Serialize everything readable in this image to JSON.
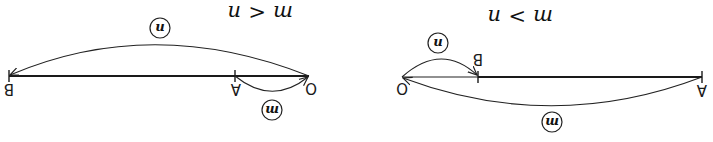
{
  "figure": {
    "orientation": "rotated 180 degrees",
    "panels": [
      {
        "id": "left",
        "condition": "m < n",
        "points": [
          {
            "label": "B",
            "position": "far end"
          },
          {
            "label": "A",
            "position": "middle"
          },
          {
            "label": "O",
            "position": "origin"
          }
        ],
        "arcs": [
          {
            "label": "n",
            "from": "O",
            "to": "B",
            "side": "above"
          },
          {
            "label": "m",
            "from": "A",
            "to": "O",
            "side": "below"
          }
        ]
      },
      {
        "id": "right",
        "condition": "m > n",
        "points": [
          {
            "label": "O",
            "position": "origin"
          },
          {
            "label": "B",
            "position": "near"
          },
          {
            "label": "A",
            "position": "far end"
          }
        ],
        "arcs": [
          {
            "label": "n",
            "from": "O",
            "to": "B",
            "side": "above"
          },
          {
            "label": "m",
            "from": "A",
            "to": "O",
            "side": "below"
          }
        ]
      }
    ]
  },
  "labels": {
    "left_condition_lhs": "m",
    "left_condition_op": "<",
    "left_condition_rhs": "n",
    "right_condition_lhs": "m",
    "right_condition_op": ">",
    "right_condition_rhs": "n",
    "point_O": "O",
    "point_A": "A",
    "point_B": "B",
    "arc_n": "n",
    "arc_m": "m"
  },
  "colors": {
    "ink": "#1a1a1a",
    "background": "#ffffff"
  }
}
